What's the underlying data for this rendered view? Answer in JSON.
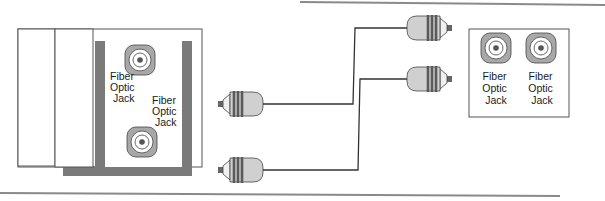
{
  "diagram": {
    "title": "",
    "left_panel": {
      "jacks": [
        {
          "label_lines": [
            "Fiber",
            "Optic",
            "Jack"
          ]
        },
        {
          "label_lines": [
            "Fiber",
            "Optic",
            "Jack"
          ]
        }
      ]
    },
    "right_panel": {
      "jacks": [
        {
          "label_lines": [
            "Fiber",
            "Optic",
            "Jack"
          ]
        },
        {
          "label_lines": [
            "Fiber",
            "Optic",
            "Jack"
          ]
        }
      ]
    },
    "cables": [
      {
        "name": "cable-1",
        "from": "left-connector-upper",
        "to": "right-connector-upper"
      },
      {
        "name": "cable-2",
        "from": "left-connector-lower",
        "to": "right-connector-lower"
      }
    ],
    "colors": {
      "panel_dark": "#7a7a7a",
      "jack_outer": "#a8a8a8",
      "jack_inner": "#ffffff",
      "connector_body": "#d0d0d0",
      "ring": "#5a5a5a",
      "line": "#333333",
      "rule": "#8a8a8a"
    }
  }
}
